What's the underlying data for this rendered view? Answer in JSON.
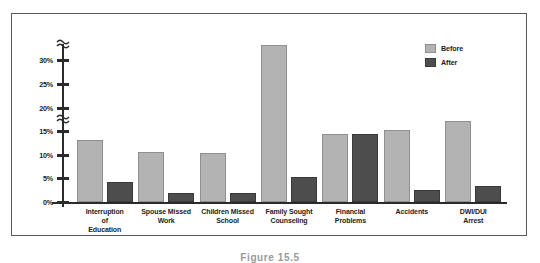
{
  "figure": {
    "caption": "Figure 15.5"
  },
  "legend": {
    "position": "top-right",
    "entries": [
      {
        "label": "Before",
        "color": "#b3b3b3"
      },
      {
        "label": "After",
        "color": "#4d4d4d"
      }
    ]
  },
  "axis": {
    "y_tick_labels": [
      "30%",
      "25%",
      "20%",
      "15%",
      "10%",
      "5%",
      "0%"
    ],
    "break_note": "axis break between 15% and 20%, and above 30%"
  },
  "chart_data": {
    "type": "bar",
    "title": "",
    "xlabel": "",
    "ylabel": "",
    "ylim": [
      0,
      35
    ],
    "grid": false,
    "legend_position": "top-right",
    "axis_break": true,
    "ytick_values": [
      0,
      5,
      10,
      15,
      20,
      25,
      30
    ],
    "ytick_labels": [
      "0%",
      "5%",
      "10%",
      "15%",
      "20%",
      "25%",
      "30%"
    ],
    "categories": [
      "Interruption of Education",
      "Spouse Missed Work",
      "Children Missed School",
      "Family Sought Counseling",
      "Financial Problems",
      "Accidents",
      "DWI/DUI Arrest"
    ],
    "category_lines": [
      [
        "Interruption",
        "of",
        "Education"
      ],
      [
        "Spouse Missed",
        "Work"
      ],
      [
        "Children Missed",
        "School"
      ],
      [
        "Family Sought",
        "Counseling"
      ],
      [
        "Financial",
        "Problems"
      ],
      [
        "Accidents"
      ],
      [
        "DWI/DUI",
        "Arrest"
      ]
    ],
    "series": [
      {
        "name": "Before",
        "color": "#b3b3b3",
        "values": [
          13,
          10.5,
          10.3,
          33,
          14.2,
          15,
          17
        ]
      },
      {
        "name": "After",
        "color": "#4d4d4d",
        "values": [
          4.2,
          1.8,
          1.8,
          5.2,
          14.2,
          2.5,
          3.4
        ]
      }
    ]
  }
}
